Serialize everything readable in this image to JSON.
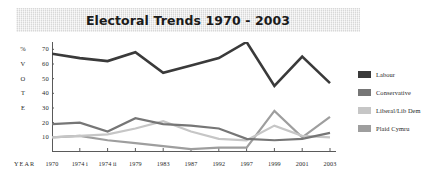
{
  "chart_data": {
    "type": "line",
    "title": "Electoral Trends 1970 - 2003",
    "xlabel": "YEAR",
    "ylabel": "% VOTE",
    "ylabel_chars": [
      "%",
      "V",
      "O",
      "T",
      "E"
    ],
    "categories": [
      "1970",
      "1974 i",
      "1974 ii",
      "1979",
      "1983",
      "1987",
      "1992",
      "1997",
      "1999",
      "2001",
      "2003"
    ],
    "yticks": [
      70,
      60,
      50,
      40,
      30,
      20,
      10
    ],
    "ylim": [
      0,
      75
    ],
    "grid": false,
    "legend_position": "right",
    "series": [
      {
        "name": "Labour",
        "color": "#3a3a3a",
        "values": [
          67,
          64,
          62,
          68,
          54,
          59,
          64,
          75,
          45,
          65,
          47
        ]
      },
      {
        "name": "Conservative",
        "color": "#767676",
        "values": [
          19,
          20,
          14,
          23,
          19,
          18,
          16,
          9,
          8,
          9,
          13
        ]
      },
      {
        "name": "Liberal/Lib Dem",
        "color": "#c6c6c6",
        "values": [
          10,
          11,
          12,
          16,
          21,
          14,
          9,
          8,
          18,
          11,
          10
        ]
      },
      {
        "name": "Plaid Cymru",
        "color": "#9e9e9e",
        "values": [
          10,
          11,
          8,
          6,
          4,
          2,
          3,
          3,
          28,
          10,
          24
        ]
      }
    ]
  }
}
